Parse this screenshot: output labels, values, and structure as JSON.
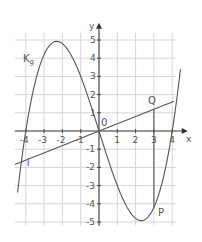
{
  "chart_data": {
    "type": "line",
    "title": "",
    "xlabel": "x",
    "ylabel": "y",
    "xlim": [
      -4.6,
      4.5
    ],
    "ylim": [
      -5.2,
      5.3
    ],
    "grid": true,
    "x_ticks": [
      "-4",
      "-3",
      "-2",
      "-1",
      "1",
      "2",
      "3",
      "4"
    ],
    "y_ticks": [
      "5",
      "4",
      "3",
      "2",
      "1",
      "-1",
      "-2",
      "-3",
      "-4",
      "-5"
    ],
    "origin_label": "0",
    "series": [
      {
        "name": "K_g",
        "label": "K",
        "label_sub": "g",
        "function": "f(x) = 0.2x^3 - 3.2x",
        "coeff_a": 0.2,
        "coeff_b": -3.2,
        "x_range": [
          -4.45,
          4.45
        ]
      },
      {
        "name": "i",
        "label": "i",
        "function": "i(x) = 0.4x",
        "slope": 0.4,
        "x_range": [
          -4.6,
          4.1
        ]
      }
    ],
    "points": [
      {
        "label": "Q",
        "x": 3,
        "y": 1.2
      },
      {
        "label": "P",
        "x": 3,
        "y": -4.2
      },
      {
        "label": "0",
        "x": 0,
        "y": 0
      }
    ],
    "annotations": [
      {
        "type": "segment",
        "from": "Q",
        "to": "P"
      }
    ]
  }
}
